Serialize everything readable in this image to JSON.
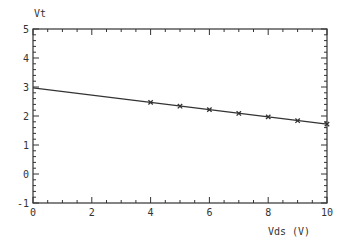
{
  "chart_data": {
    "type": "line",
    "title": "",
    "xlabel": "Vds (V)",
    "ylabel": "Vt",
    "xlim": [
      0,
      10
    ],
    "ylim": [
      -1,
      5
    ],
    "x_ticks": [
      0,
      2,
      4,
      6,
      8,
      10
    ],
    "x_tick_labels": [
      "0",
      "2",
      "4",
      "6",
      "8",
      "10"
    ],
    "y_ticks": [
      -1,
      0,
      1,
      2,
      3,
      4,
      5
    ],
    "y_tick_labels": [
      "-1",
      "0",
      "1",
      "2",
      "3",
      "4",
      "5"
    ],
    "grid": false,
    "series": [
      {
        "name": "fit",
        "style": "line",
        "x": [
          0,
          10
        ],
        "values": [
          2.97,
          1.72
        ]
      },
      {
        "name": "measured",
        "style": "markers",
        "marker": "x",
        "x": [
          4,
          5,
          6,
          7,
          8,
          9,
          10
        ],
        "values": [
          2.47,
          2.34,
          2.22,
          2.09,
          1.97,
          1.84,
          1.72
        ]
      }
    ]
  },
  "colors": {
    "axis": "#333333",
    "line": "#333333"
  }
}
